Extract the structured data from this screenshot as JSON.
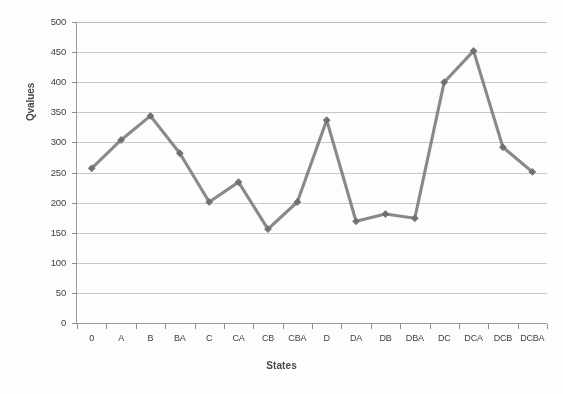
{
  "chart_data": {
    "type": "line",
    "title": "",
    "xlabel": "States",
    "ylabel": "Qvalues",
    "categories": [
      "0",
      "A",
      "B",
      "BA",
      "C",
      "CA",
      "CB",
      "CBA",
      "D",
      "DA",
      "DB",
      "DBA",
      "DC",
      "DCA",
      "DCB",
      "DCBA"
    ],
    "values": [
      257,
      304,
      344,
      282,
      201,
      234,
      156,
      201,
      337,
      169,
      181,
      174,
      400,
      452,
      292,
      251
    ],
    "ylim": [
      0,
      500
    ],
    "ytick_labels": [
      "500",
      "450",
      "400",
      "350",
      "300",
      "250",
      "200",
      "150",
      "100",
      "50",
      "0"
    ],
    "ytick_values": [
      500,
      450,
      400,
      350,
      300,
      250,
      200,
      150,
      100,
      50,
      0
    ],
    "ytick_step": 50,
    "grid": "horizontal",
    "legend": "none",
    "series_name": "Qvalues",
    "series_color": "#7f7f7f",
    "marker": "diamond",
    "gridline_color": "#c9c9c9",
    "axis_color": "#9a9a9a",
    "background_color": "#fdfdfd",
    "text_color": "#3f3f3f"
  }
}
